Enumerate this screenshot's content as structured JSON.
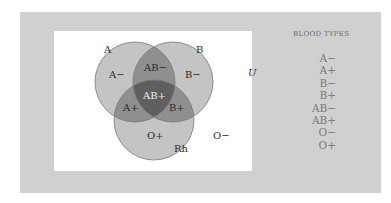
{
  "diagram": {
    "type": "venn",
    "universe_label": "U",
    "sets": [
      {
        "name": "A",
        "label": "A",
        "cx": 135,
        "cy": 82,
        "r": 40
      },
      {
        "name": "B",
        "label": "B",
        "cx": 173,
        "cy": 82,
        "r": 40
      },
      {
        "name": "Rh",
        "label": "Rh",
        "cx": 154,
        "cy": 120,
        "r": 40
      }
    ],
    "regions": {
      "a_only": "A−",
      "b_only": "B−",
      "ab_only": "AB−",
      "a_rh": "A+",
      "b_rh": "B+",
      "ab_rh": "AB+",
      "rh_only": "O+",
      "outside": "O−"
    },
    "colors": {
      "panel": "#d0d0d0",
      "single": "#c4c4c4",
      "double": "#8f8f8f",
      "triple": "#5f5f5f",
      "outline": "#777777"
    }
  },
  "legend": {
    "title": "BLOOD TYPES",
    "items": [
      "A−",
      "A+",
      "B−",
      "B+",
      "AB−",
      "AB+",
      "O−",
      "O+"
    ]
  }
}
